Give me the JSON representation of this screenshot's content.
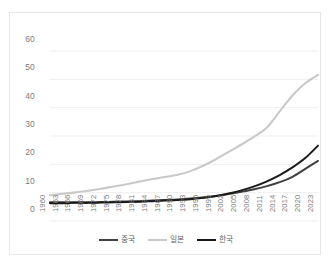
{
  "chart_data": {
    "type": "line",
    "title": "",
    "subtitle": "",
    "xlabel": "",
    "ylabel": "",
    "xlim": [
      1960,
      2023
    ],
    "ylim": [
      0,
      60
    ],
    "grid": true,
    "grid_axis": "y",
    "legend_position": "bottom",
    "yticks": [
      0,
      10,
      20,
      30,
      40,
      50,
      60
    ],
    "categories": [
      "1960",
      "1963",
      "1966",
      "1969",
      "1972",
      "1975",
      "1978",
      "1981",
      "1984",
      "1987",
      "1990",
      "1993",
      "1996",
      "1999",
      "2002",
      "2005",
      "2008",
      "2011",
      "2014",
      "2017",
      "2020",
      "2023"
    ],
    "series": [
      {
        "name": "중국",
        "color": "#404040",
        "values": [
          6.6,
          6.6,
          6.6,
          6.6,
          6.7,
          6.8,
          6.9,
          7.0,
          7.2,
          7.4,
          7.6,
          7.9,
          8.3,
          8.8,
          9.5,
          10.3,
          11.2,
          12.3,
          13.7,
          15.6,
          18.4,
          21.2
        ]
      },
      {
        "name": "일본",
        "color": "#c9c9c9",
        "values": [
          9.1,
          9.6,
          10.1,
          10.7,
          11.4,
          12.2,
          13.0,
          13.9,
          14.8,
          15.5,
          16.3,
          17.6,
          19.5,
          21.8,
          24.4,
          27.0,
          29.8,
          33.0,
          38.7,
          44.3,
          48.6,
          51.6
        ]
      },
      {
        "name": "한국",
        "color": "#1a1a1a",
        "values": [
          6.3,
          6.3,
          6.4,
          6.4,
          6.5,
          6.6,
          6.7,
          6.8,
          7.0,
          7.2,
          7.4,
          7.7,
          8.2,
          8.8,
          9.7,
          10.8,
          12.2,
          14.0,
          16.2,
          18.9,
          22.2,
          26.6
        ]
      }
    ]
  }
}
